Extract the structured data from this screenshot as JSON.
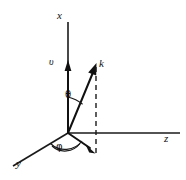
{
  "figure": {
    "kind": "3d-spherical-coordinate-vector-diagram",
    "background_color": "#ffffff",
    "stroke_color": "#1a1a1a",
    "width": 186,
    "height": 180
  },
  "origin": {
    "x": 68,
    "y": 133
  },
  "axes": [
    {
      "id": "x",
      "label": "x",
      "orientation": "vertical-up",
      "from": {
        "x": 68,
        "y": 133
      },
      "to": {
        "x": 68,
        "y": 22
      },
      "label_position": {
        "x": 57,
        "y": 10
      },
      "has_arrowhead": true,
      "arrowhead_at": {
        "x": 68,
        "y": 62
      }
    },
    {
      "id": "z",
      "label": "z",
      "orientation": "horizontal-right",
      "from": {
        "x": 68,
        "y": 133
      },
      "to": {
        "x": 180,
        "y": 133
      },
      "label_position": {
        "x": 164,
        "y": 133
      },
      "has_arrowhead": false
    },
    {
      "id": "y",
      "label": "y",
      "orientation": "oblique-down-left",
      "from": {
        "x": 68,
        "y": 133
      },
      "to": {
        "x": 13,
        "y": 166
      },
      "label_position": {
        "x": 16,
        "y": 158
      },
      "has_arrowhead": false
    }
  ],
  "vectors": [
    {
      "id": "k",
      "label": "k",
      "description": "wave vector from origin into first octant",
      "from": {
        "x": 68,
        "y": 133
      },
      "to": {
        "x": 96,
        "y": 65
      },
      "label_position": {
        "x": 99,
        "y": 58
      },
      "style": "solid",
      "has_arrowhead": true
    },
    {
      "id": "v",
      "label": "v",
      "description": "velocity arrow marker on the x axis",
      "from": {
        "x": 68,
        "y": 133
      },
      "to": {
        "x": 68,
        "y": 62
      },
      "label_position": {
        "x": 49,
        "y": 57
      },
      "style": "solid",
      "has_arrowhead": true
    },
    {
      "id": "k-projection",
      "label": "",
      "description": "projection of k onto the y-z plane",
      "from": {
        "x": 68,
        "y": 133
      },
      "to": {
        "x": 95,
        "y": 153
      },
      "style": "solid",
      "has_arrowhead": true
    }
  ],
  "dashed_lines": [
    {
      "id": "k-to-projection",
      "description": "dashed drop line from tip of k down to its projection",
      "from": {
        "x": 96,
        "y": 66
      },
      "to": {
        "x": 96,
        "y": 156
      }
    }
  ],
  "angles": [
    {
      "id": "theta",
      "label": "θ",
      "description": "polar angle between x axis and vector k",
      "label_position": {
        "x": 65,
        "y": 90
      },
      "vertex": {
        "x": 68,
        "y": 133
      },
      "radius": 36
    },
    {
      "id": "phi",
      "label": "φ",
      "description": "azimuthal angle between y axis and projection of k",
      "label_position": {
        "x": 56,
        "y": 142
      },
      "vertex": {
        "x": 68,
        "y": 133
      },
      "radius": 22
    }
  ],
  "labels": {
    "x": "x",
    "y": "y",
    "z": "z",
    "k": "k",
    "v": "υ",
    "theta": "θ",
    "phi": "φ"
  }
}
